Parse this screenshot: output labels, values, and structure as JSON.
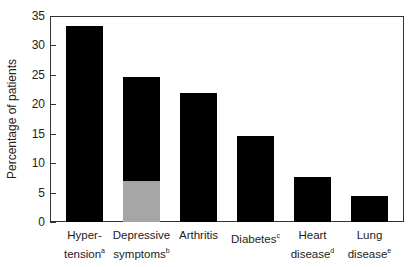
{
  "chart_data": {
    "type": "bar",
    "title": "",
    "xlabel": "",
    "ylabel": "Percentage of patients",
    "ylim": [
      0,
      35
    ],
    "yticks": [
      0,
      5,
      10,
      15,
      20,
      25,
      30,
      35
    ],
    "grid": false,
    "legend": null,
    "categories": [
      {
        "line1": "Hyper-",
        "line2": "tension",
        "sup": "a"
      },
      {
        "line1": "Depressive",
        "line2": "symptoms",
        "sup": "b"
      },
      {
        "line1": "Arthritis",
        "line2": "",
        "sup": ""
      },
      {
        "line1": "Diabetes",
        "line2": "",
        "sup": "c"
      },
      {
        "line1": "Heart",
        "line2": "disease",
        "sup": "d"
      },
      {
        "line1": "Lung",
        "line2": "disease",
        "sup": "e"
      }
    ],
    "values": [
      33.3,
      24.6,
      21.9,
      14.6,
      7.6,
      4.4
    ],
    "highlighted_subsegment": {
      "category_index": 1,
      "value": 7.0,
      "color": "#a6a6a6"
    },
    "bar_color": "#000000"
  }
}
